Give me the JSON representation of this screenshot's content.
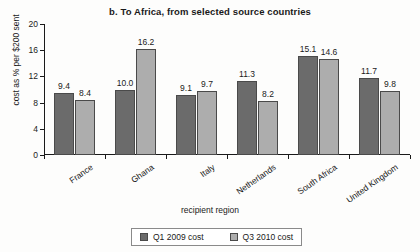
{
  "chart_data": {
    "type": "bar",
    "title": "b. To Africa, from selected source countries",
    "xlabel": "recipient region",
    "ylabel": "cost as % per $200 sent",
    "categories": [
      "France",
      "Ghana",
      "Italy",
      "Netherlands",
      "South Africa",
      "United Kingdom"
    ],
    "series": [
      {
        "name": "Q1 2009 cost",
        "color": "#6b6b6b",
        "values": [
          9.4,
          10.0,
          9.1,
          11.3,
          15.1,
          11.7
        ]
      },
      {
        "name": "Q3 2010 cost",
        "color": "#adadad",
        "values": [
          8.4,
          16.2,
          9.7,
          8.2,
          14.6,
          9.8
        ]
      }
    ],
    "ylim": [
      0,
      20
    ],
    "yticks": [
      0,
      4,
      8,
      12,
      16,
      20
    ],
    "ytick_labels": [
      "0",
      "4",
      "8",
      "12",
      "16",
      "20"
    ],
    "grid": false,
    "legend_position": "bottom",
    "data_labels": [
      [
        "9.4",
        "8.4"
      ],
      [
        "10.0",
        "16.2"
      ],
      [
        "9.1",
        "9.7"
      ],
      [
        "11.3",
        "8.2"
      ],
      [
        "15.1",
        "14.6"
      ],
      [
        "11.7",
        "9.8"
      ]
    ]
  }
}
